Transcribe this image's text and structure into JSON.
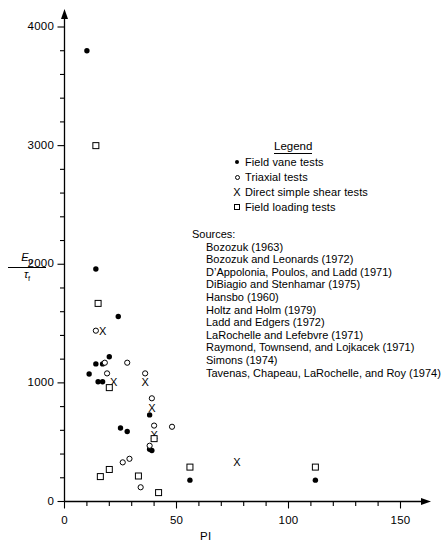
{
  "chart_data": {
    "type": "scatter",
    "title": "",
    "xlabel": "PI",
    "ylabel": "Eu / tau_f",
    "ylabel_numerator": "E",
    "ylabel_numerator_sub": "u",
    "ylabel_denominator": "τ",
    "ylabel_denominator_sub": "f",
    "xlim": [
      0,
      150
    ],
    "ylim": [
      0,
      4200
    ],
    "xticks": [
      0,
      50,
      100,
      150
    ],
    "xtick_labels": [
      "0",
      "50",
      "100",
      "150"
    ],
    "x_minor_tick_step": 10,
    "yticks": [
      0,
      1000,
      2000,
      3000,
      4000
    ],
    "ytick_labels": [
      "0",
      "1000",
      "2000",
      "3000",
      "4000"
    ],
    "y_minor_tick_step": 200,
    "grid": false,
    "legend_position": "upper-right",
    "series": [
      {
        "name": "Field vane tests",
        "marker": "filled-circle",
        "points": [
          [
            10,
            3800
          ],
          [
            14,
            1960
          ],
          [
            24,
            1560
          ],
          [
            20,
            1220
          ],
          [
            14,
            1160
          ],
          [
            17,
            1160
          ],
          [
            11,
            1075
          ],
          [
            15,
            1010
          ],
          [
            17,
            1010
          ],
          [
            38,
            730
          ],
          [
            25,
            620
          ],
          [
            28,
            590
          ],
          [
            38,
            440
          ],
          [
            39,
            430
          ],
          [
            56,
            180
          ],
          [
            112,
            180
          ]
        ]
      },
      {
        "name": "Triaxial tests",
        "marker": "open-circle",
        "points": [
          [
            14,
            1440
          ],
          [
            18,
            1170
          ],
          [
            28,
            1170
          ],
          [
            19,
            1080
          ],
          [
            36,
            1080
          ],
          [
            39,
            870
          ],
          [
            40,
            640
          ],
          [
            48,
            630
          ],
          [
            38,
            470
          ],
          [
            26,
            330
          ],
          [
            29,
            360
          ],
          [
            34,
            120
          ]
        ]
      },
      {
        "name": "Direct simple shear tests",
        "marker": "x",
        "points": [
          [
            17,
            1440
          ],
          [
            22,
            1010
          ],
          [
            36,
            1010
          ],
          [
            39,
            790
          ],
          [
            40,
            560
          ],
          [
            77,
            330
          ]
        ]
      },
      {
        "name": "Field loading tests",
        "marker": "open-square",
        "points": [
          [
            14,
            3000
          ],
          [
            15,
            1670
          ],
          [
            20,
            960
          ],
          [
            40,
            530
          ],
          [
            56,
            290
          ],
          [
            112,
            290
          ],
          [
            16,
            210
          ],
          [
            20,
            270
          ],
          [
            33,
            215
          ],
          [
            42,
            75
          ]
        ]
      }
    ]
  },
  "legend": {
    "title": "Legend",
    "items": [
      {
        "marker": "filled-circle",
        "label": "Field vane tests"
      },
      {
        "marker": "open-circle",
        "label": "Triaxial tests"
      },
      {
        "marker": "x",
        "label": "Direct simple shear tests"
      },
      {
        "marker": "open-square",
        "label": "Field loading tests"
      }
    ]
  },
  "sources": {
    "heading": "Sources:",
    "items": [
      "Bozozuk (1963)",
      "Bozozuk and Leonards (1972)",
      "D’Appolonia, Poulos, and Ladd (1971)",
      "DiBiagio and Stenhamar (1975)",
      "Hansbo (1960)",
      "Holtz and Holm (1979)",
      "Ladd and Edgers (1972)",
      "LaRochelle and Lefebvre (1971)",
      "Raymond, Townsend, and Lojkacek (1971)",
      "Simons (1974)",
      "Tavenas, Chapeau, LaRochelle, and Roy (1974)"
    ]
  },
  "colors": {
    "axis": "#000000",
    "marker": "#000000",
    "background": "#ffffff"
  }
}
